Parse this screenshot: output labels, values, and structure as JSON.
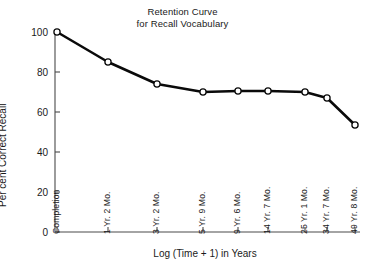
{
  "chart_data": {
    "type": "line",
    "title": "Retention Curve for Recall Vocabulary",
    "title_lines": [
      "Retention Curve",
      "for Recall Vocabulary"
    ],
    "xlabel": "Log (Time + 1) in Years",
    "ylabel": "Per cent Correct Recall",
    "categories": [
      "Completion",
      "1 Yr. 2 Mo.",
      "3 Yr. 2 Mo.",
      "5 Yr. 9 Mo.",
      "9 Yr. 6 Mo.",
      "14 Yr. 7 Mo.",
      "25 Yr. 1 Mo.",
      "34 Yr. 7 Mo.",
      "49 Yr. 8 Mo."
    ],
    "values": [
      100,
      85,
      74,
      70,
      70.5,
      70.5,
      70,
      67,
      53.5
    ],
    "x_positions": [
      57,
      108,
      157,
      203,
      238,
      268,
      305,
      327,
      355
    ],
    "ylim": [
      0,
      100
    ],
    "yticks": [
      0,
      20,
      40,
      60,
      80,
      100
    ],
    "ytick_labels": [
      "0",
      "20",
      "40",
      "60",
      "80",
      "100"
    ],
    "grid": false,
    "legend": "none",
    "marker": "open-circle",
    "line_color": "#0a0a0a",
    "marker_fill": "#ffffff",
    "background": "#ffffff"
  }
}
